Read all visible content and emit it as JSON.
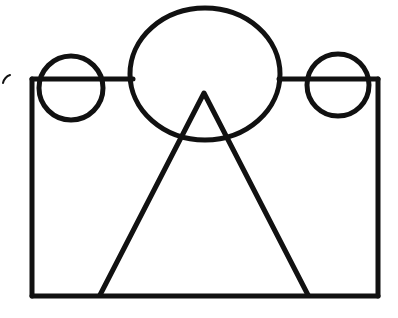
{
  "document": {
    "title": "Hand-drawn geometric line figure",
    "background_color": "#ffffff",
    "stroke_color": "#111111",
    "width": 398,
    "height": 318
  },
  "figure": {
    "shapes": [
      {
        "id": "rectangle-body",
        "name": "rectangle",
        "kind": "rectangle",
        "x": 32,
        "y": 79,
        "width": 346,
        "height": 217,
        "stroke_width": 5,
        "note": "Top edge is interrupted where the large ellipse crosses it"
      },
      {
        "id": "rect-top-left-segment",
        "name": "rectangle-top-edge-left-segment",
        "kind": "line",
        "x1": 32,
        "y1": 79,
        "x2": 133,
        "y2": 79,
        "stroke_width": 5
      },
      {
        "id": "rect-top-right-segment",
        "name": "rectangle-top-edge-right-segment",
        "kind": "line",
        "x1": 279,
        "y1": 79,
        "x2": 378,
        "y2": 79,
        "stroke_width": 5
      },
      {
        "id": "ellipse-center",
        "name": "large-central-ellipse",
        "kind": "ellipse",
        "cx": 205,
        "cy": 74,
        "rx": 75,
        "ry": 66,
        "stroke_width": 5
      },
      {
        "id": "circle-left",
        "name": "left-small-circle",
        "kind": "circle",
        "cx": 71,
        "cy": 88,
        "r": 32,
        "stroke_width": 5
      },
      {
        "id": "circle-right",
        "name": "right-small-circle",
        "kind": "circle",
        "cx": 338,
        "cy": 85,
        "r": 31,
        "stroke_width": 5
      },
      {
        "id": "triangle-main",
        "name": "large-triangle",
        "kind": "triangle",
        "points": "204,93 308,295 100,295",
        "apex": [
          204,
          93
        ],
        "base_left": [
          100,
          295
        ],
        "base_right": [
          308,
          295
        ],
        "stroke_width": 5,
        "note": "Base sits on the rectangle's bottom edge; only the two slanted sides are drawn"
      },
      {
        "id": "stray-tick",
        "name": "stray-tick-mark",
        "kind": "tick",
        "path": "M 3 83 C 4 79, 7 76, 10 75",
        "stroke_width": 2,
        "note": "Small faint hook-shaped mark outside the rectangle at the far left"
      }
    ]
  }
}
